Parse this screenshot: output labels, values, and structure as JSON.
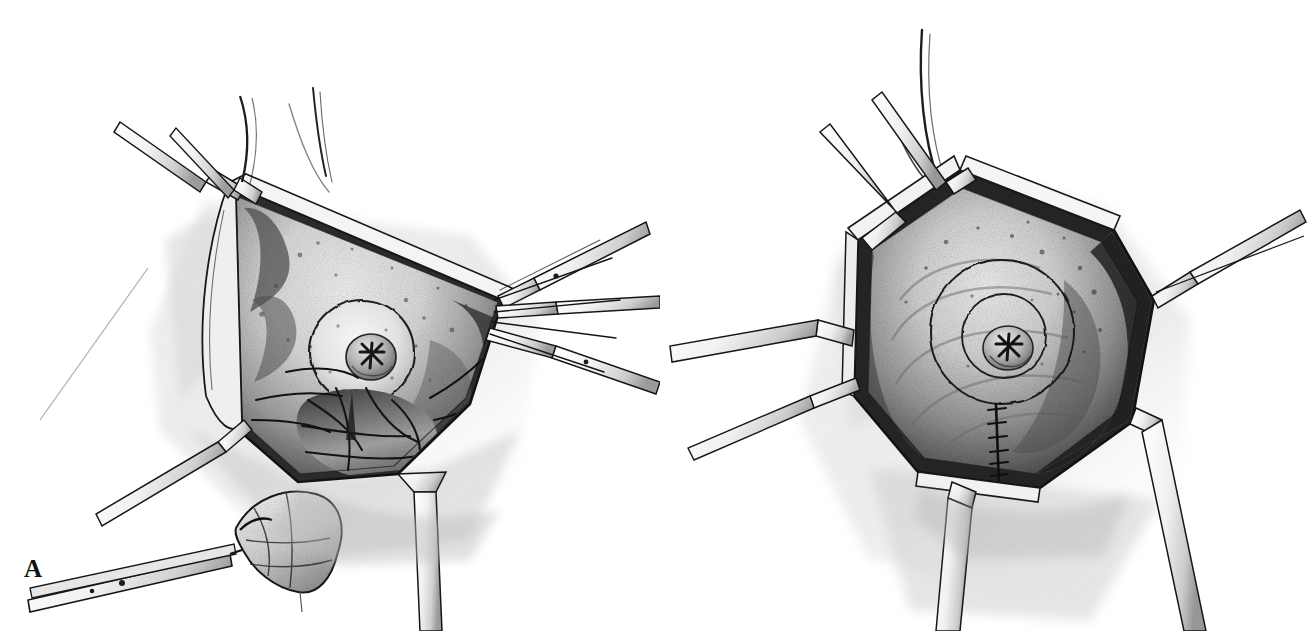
{
  "figure": {
    "style": "graphite pencil medical illustration",
    "background_color": "#ffffff",
    "ink_color": "#1a1a1a",
    "panel_count": 2
  },
  "panels": [
    {
      "id": "A",
      "label": "A",
      "caption_letter": "A",
      "description": "Open surgical field: triangular wound retracted by multiple blade retractors exposing the breast mound with nipple-areola complex; glandular tissue dissected inferiorly; a forceps at lower left grasps the excised specimen.",
      "elements": {
        "wound_shape": "triangular",
        "retractor_count": 9,
        "areola_visible": true,
        "nipple_visible": true,
        "specimen_in_forceps": true,
        "suture_line": false,
        "glandular_flap": true
      }
    },
    {
      "id": "B",
      "label": "B",
      "caption_letter": "B",
      "description": "Completed stage: hexagonal wound held open by retractors showing the reshaped breast mound, concentric areolar markings, and a short vertical suture line descending from the inferior areolar border.",
      "elements": {
        "wound_shape": "hexagonal",
        "retractor_count": 7,
        "areola_visible": true,
        "nipple_visible": true,
        "specimen_in_forceps": false,
        "suture_line": true,
        "suture_stitch_count": 7,
        "glandular_flap": false
      }
    }
  ],
  "colors": {
    "background": "#ffffff",
    "outline": "#1a1a1a",
    "label_text": "#111111",
    "shadow_gray": "#9a9a9a",
    "midtone_gray": "#c9c9c9",
    "deep_shadow": "#3a3a3a",
    "skin_light": "#ededed"
  }
}
